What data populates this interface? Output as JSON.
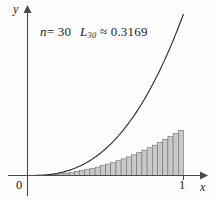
{
  "figure": {
    "annotation": {
      "n_symbol": "n",
      "n_equals": "= 30",
      "L_symbol": "L",
      "L_subscript": "30",
      "L_value": "≈ 0.3169",
      "full_text": "n = 30   L₃₀ ≈ 0.3169"
    },
    "axis_labels": {
      "y": "y",
      "x": "x",
      "origin": "0",
      "x_tick_one": "1"
    },
    "colors": {
      "bar_fill": "#c9c9c9",
      "bar_stroke": "#6e6e6e",
      "curve": "#2b2b2b",
      "axis": "#4a4a4a",
      "text": "#1a1a1a",
      "background": "#fefefe"
    }
  },
  "chart_data": {
    "type": "area",
    "title": "",
    "subtitle": "",
    "xlabel": "x",
    "ylabel": "y",
    "xlim": [
      0,
      1.13
    ],
    "ylim": [
      0,
      1.16
    ],
    "grid": false,
    "legend": false,
    "legend_position": "none",
    "annotations": [
      {
        "text": "n = 30",
        "x": 0.09,
        "y": 1.0
      },
      {
        "text": "L₃₀ ≈ 0.3169",
        "x": 0.37,
        "y": 1.0
      }
    ],
    "x_ticks": [
      0,
      1
    ],
    "x_tick_labels": [
      "0",
      "1"
    ],
    "y_ticks": [],
    "y_tick_labels": [],
    "curve": {
      "name": "f(x) = x^2.6",
      "exponent": 2.6,
      "x": [
        0.0,
        0.05,
        0.1,
        0.15,
        0.2,
        0.25,
        0.3,
        0.35,
        0.4,
        0.45,
        0.5,
        0.55,
        0.6,
        0.65,
        0.7,
        0.75,
        0.8,
        0.85,
        0.9,
        0.95,
        1.0
      ],
      "y": [
        0.0,
        0.0004,
        0.0025,
        0.0068,
        0.0144,
        0.0258,
        0.0418,
        0.0629,
        0.0897,
        0.1226,
        0.1649,
        0.2089,
        0.2627,
        0.3242,
        0.3938,
        0.4721,
        0.5595,
        0.6564,
        0.7633,
        0.8806,
        1.0
      ]
    },
    "riemann": {
      "n": 30,
      "rule": "left-endpoint",
      "sum_label": "L_30",
      "sum_value": 0.3169,
      "interval": [
        0,
        1
      ],
      "delta_x": 0.0333,
      "bar_left_edges": [
        0.0,
        0.0333,
        0.0667,
        0.1,
        0.1333,
        0.1667,
        0.2,
        0.2333,
        0.2667,
        0.3,
        0.3333,
        0.3667,
        0.4,
        0.4333,
        0.4667,
        0.5,
        0.5333,
        0.5667,
        0.6,
        0.6333,
        0.6667,
        0.7,
        0.7333,
        0.7667,
        0.8,
        0.8333,
        0.8667,
        0.9,
        0.9333,
        0.9667
      ],
      "bar_heights": [
        0.0,
        0.0002,
        0.0011,
        0.0025,
        0.0046,
        0.0073,
        0.0106,
        0.0145,
        0.0192,
        0.0244,
        0.0304,
        0.037,
        0.0443,
        0.0523,
        0.061,
        0.0704,
        0.0805,
        0.0914,
        0.1029,
        0.1152,
        0.1283,
        0.1421,
        0.1566,
        0.1719,
        0.188,
        0.2048,
        0.2224,
        0.2408,
        0.26,
        0.28
      ]
    }
  }
}
